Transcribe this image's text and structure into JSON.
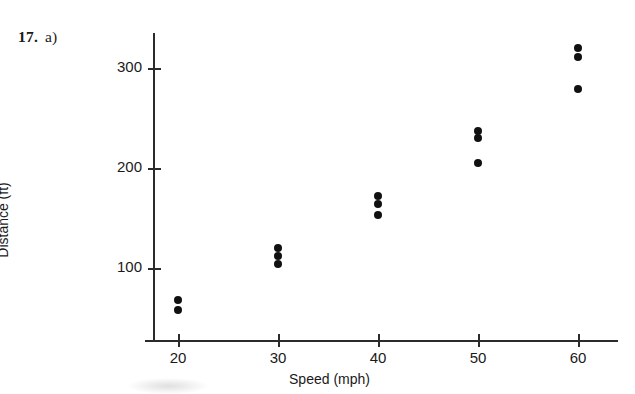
{
  "problem": {
    "number": "17.",
    "part": "a)"
  },
  "chart_data": {
    "type": "scatter",
    "title": "",
    "xlabel": "Speed (mph)",
    "ylabel": "Distance (ft)",
    "xlim": [
      15,
      65
    ],
    "ylim": [
      30,
      340
    ],
    "xticks": [
      20,
      30,
      40,
      50,
      60
    ],
    "xtick_labels": [
      "20",
      "30",
      "40",
      "50",
      "60"
    ],
    "yticks": [
      100,
      200,
      300
    ],
    "ytick_labels": [
      "100",
      "200",
      "300"
    ],
    "grid": false,
    "legend": null,
    "marker": "filled-circle",
    "marker_color": "#111111",
    "axis_color": "#2b2b2b",
    "points": [
      {
        "x": 20,
        "y": 68
      },
      {
        "x": 20,
        "y": 58
      },
      {
        "x": 30,
        "y": 120
      },
      {
        "x": 30,
        "y": 112
      },
      {
        "x": 30,
        "y": 104
      },
      {
        "x": 40,
        "y": 172
      },
      {
        "x": 40,
        "y": 164
      },
      {
        "x": 40,
        "y": 153
      },
      {
        "x": 50,
        "y": 237
      },
      {
        "x": 50,
        "y": 230
      },
      {
        "x": 50,
        "y": 205
      },
      {
        "x": 60,
        "y": 320
      },
      {
        "x": 60,
        "y": 311
      },
      {
        "x": 60,
        "y": 279
      }
    ]
  }
}
